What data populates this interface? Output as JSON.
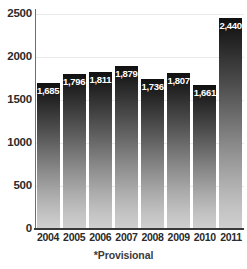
{
  "chart_data": {
    "type": "bar",
    "title": "",
    "xlabel": "",
    "ylabel": "",
    "categories": [
      "2004",
      "2005",
      "2006",
      "2007",
      "2008",
      "2009",
      "2010",
      "2011"
    ],
    "values": [
      1685,
      1796,
      1811,
      1879,
      1736,
      1807,
      1661,
      2440
    ],
    "value_labels": [
      "1,685",
      "1,796",
      "1,811",
      "1,879",
      "1,736",
      "1,807",
      "1,661",
      "2,440*"
    ],
    "ylim": [
      0,
      2500
    ],
    "ytick_values": [
      0,
      500,
      1000,
      1500,
      2000,
      2500
    ],
    "ytick_labels": [
      "0",
      "500",
      "1000",
      "1500",
      "2000",
      "2500"
    ],
    "grid": true,
    "legend": null,
    "annotations": [
      "*Provisional"
    ],
    "series": [
      {
        "name": "",
        "values": [
          1685,
          1796,
          1811,
          1879,
          1736,
          1807,
          1661,
          2440
        ]
      }
    ]
  },
  "footnote": "*Provisional",
  "colors": {
    "bar_gradient_top": "#111111",
    "bar_gradient_bottom": "#cfcfcf",
    "gridline": "#e9e9e9",
    "axis": "#3a3a3a",
    "tick_text": "#2b2b2b",
    "value_text": "#ffffff",
    "background": "#ffffff"
  }
}
